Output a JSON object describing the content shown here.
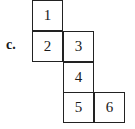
{
  "figure": {
    "label": "c.",
    "cells": [
      {
        "number": "1",
        "col": 0,
        "row": 0
      },
      {
        "number": "2",
        "col": 0,
        "row": 1
      },
      {
        "number": "3",
        "col": 1,
        "row": 1
      },
      {
        "number": "4",
        "col": 1,
        "row": 2
      },
      {
        "number": "5",
        "col": 1,
        "row": 3
      },
      {
        "number": "6",
        "col": 2,
        "row": 3
      }
    ]
  }
}
